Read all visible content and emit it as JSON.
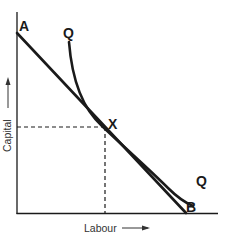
{
  "diagram": {
    "type": "isoquant-isocost",
    "labels": {
      "isocost_start": "A",
      "isocost_end": "B",
      "isoquant_top": "Q",
      "isoquant_bottom": "Q",
      "tangency_point": "X"
    },
    "axes": {
      "x_label": "Labour",
      "y_label": "Capital"
    },
    "colors": {
      "line": "#1a1a1a",
      "background": "#ffffff",
      "text": "#1a1a1a"
    }
  }
}
